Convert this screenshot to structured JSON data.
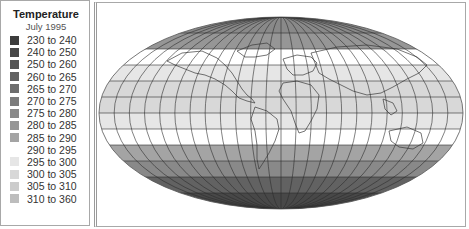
{
  "legend": {
    "title": "Temperature",
    "subtitle": "July 1995",
    "items": [
      {
        "label": "230 to 240",
        "color": "#3c3c3c"
      },
      {
        "label": "240 to 250",
        "color": "#484848"
      },
      {
        "label": "250 to 260",
        "color": "#555555"
      },
      {
        "label": "260 to 265",
        "color": "#626262"
      },
      {
        "label": "265 to 270",
        "color": "#6e6e6e"
      },
      {
        "label": "270 to 275",
        "color": "#7c7c7c"
      },
      {
        "label": "275 to 280",
        "color": "#898989"
      },
      {
        "label": "280 to 285",
        "color": "#969696"
      },
      {
        "label": "285 to 290",
        "color": "#a4a4a4"
      },
      {
        "label": "290 to 295",
        "color": "#ffffff"
      },
      {
        "label": "295 to 300",
        "color": "#e6e6e6"
      },
      {
        "label": "300 to 305",
        "color": "#d8d8d8"
      },
      {
        "label": "305 to 310",
        "color": "#cccccc"
      },
      {
        "label": "310 to 360",
        "color": "#bdbdbd"
      }
    ]
  },
  "chart_data": {
    "type": "heatmap",
    "title": "Temperature",
    "subtitle": "July 1995",
    "projection": "Mollweide (world map)",
    "legend_position": "left",
    "grid": true,
    "bins": [
      "230 to 240",
      "240 to 250",
      "250 to 260",
      "260 to 265",
      "265 to 270",
      "270 to 275",
      "275 to 280",
      "280 to 285",
      "285 to 290",
      "290 to 295",
      "295 to 300",
      "300 to 305",
      "305 to 310",
      "310 to 360"
    ],
    "latitude_bands": [
      {
        "lat_range": [
          75,
          90
        ],
        "bin": "275 to 280"
      },
      {
        "lat_range": [
          60,
          75
        ],
        "bin": "280 to 285"
      },
      {
        "lat_range": [
          45,
          60
        ],
        "bin": "290 to 295"
      },
      {
        "lat_range": [
          30,
          45
        ],
        "bin": "295 to 300"
      },
      {
        "lat_range": [
          0,
          30
        ],
        "bin": "300 to 305"
      },
      {
        "lat_range": [
          -15,
          0
        ],
        "bin": "295 to 300"
      },
      {
        "lat_range": [
          -30,
          -15
        ],
        "bin": "290 to 295"
      },
      {
        "lat_range": [
          -45,
          -30
        ],
        "bin": "285 to 290"
      },
      {
        "lat_range": [
          -60,
          -45
        ],
        "bin": "275 to 280"
      },
      {
        "lat_range": [
          -75,
          -60
        ],
        "bin": "260 to 265"
      },
      {
        "lat_range": [
          -90,
          -75
        ],
        "bin": "240 to 250"
      }
    ]
  }
}
